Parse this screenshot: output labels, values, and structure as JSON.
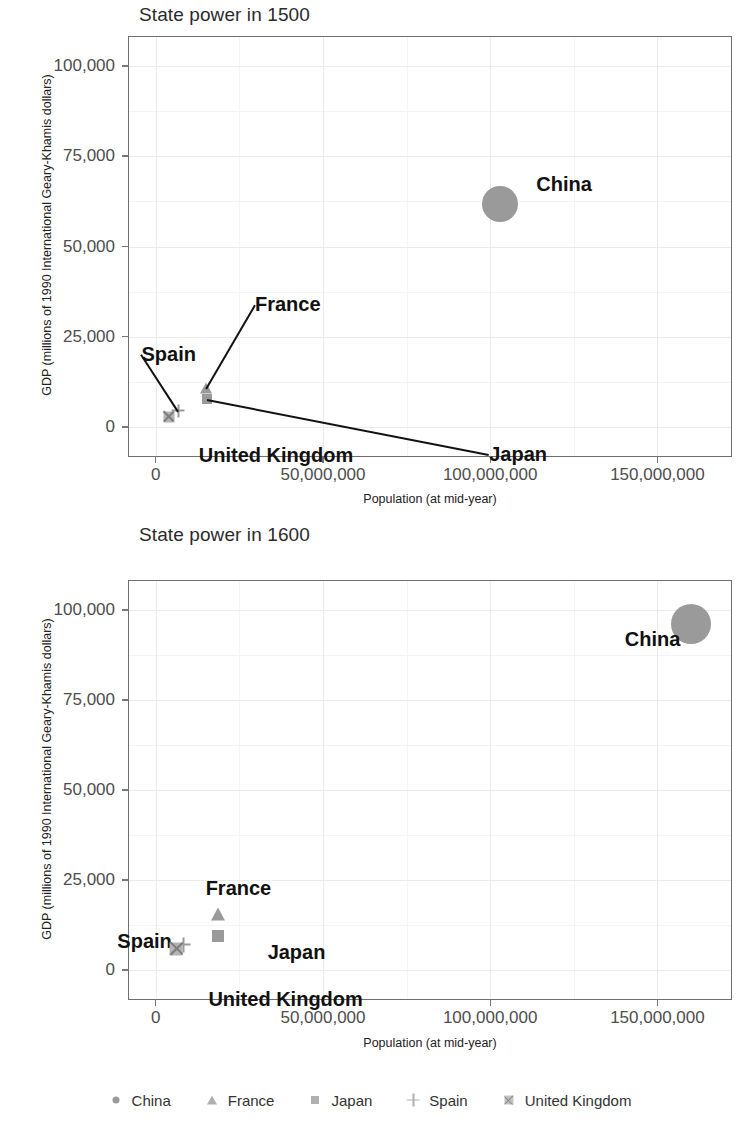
{
  "figure": {
    "legend": {
      "entries": [
        {
          "label": "China",
          "marker": "circle-icon"
        },
        {
          "label": "France",
          "marker": "triangle-icon"
        },
        {
          "label": "Japan",
          "marker": "square-icon"
        },
        {
          "label": "Spain",
          "marker": "plus-icon"
        },
        {
          "label": "United Kingdom",
          "marker": "crossed-square-icon"
        }
      ]
    },
    "marker_color": "#9a9a9a",
    "panel_border_color": "#6e6e6e",
    "grid_color": "#ebebeb"
  },
  "chart_data": [
    {
      "type": "scatter",
      "title": "State power in 1500",
      "xlabel": "Population (at mid-year)",
      "ylabel": "GDP (millions of 1990 International Geary-Khamis dollars)",
      "xlim": [
        -8000000,
        172000000
      ],
      "ylim": [
        -8000,
        108000
      ],
      "xticks": [
        0,
        50000000,
        100000000,
        150000000
      ],
      "xticklabels": [
        "0",
        "50,000,000",
        "100,000,000",
        "150,000,000"
      ],
      "yticks": [
        0,
        25000,
        50000,
        75000,
        100000
      ],
      "yticklabels": [
        "0",
        "25,000",
        "50,000",
        "75,000",
        "100,000"
      ],
      "grid": true,
      "legend_position": "bottom",
      "size_encodes": "GDP",
      "points": [
        {
          "name": "China",
          "marker": "circle",
          "x": 103000000,
          "y": 61800,
          "size": 36,
          "label": "China",
          "label_dx": 36,
          "label_dy": -30,
          "leader": false
        },
        {
          "name": "France",
          "marker": "triangle",
          "x": 15000000,
          "y": 10912,
          "size": 11,
          "label": "France",
          "label_dx": 49,
          "label_dy": -94,
          "leader": true
        },
        {
          "name": "Japan",
          "marker": "square",
          "x": 15400000,
          "y": 7700,
          "size": 10,
          "label": "Japan",
          "label_dx": 282,
          "label_dy": 45,
          "leader": true
        },
        {
          "name": "Spain",
          "marker": "plus",
          "x": 6800000,
          "y": 4495,
          "size": 10,
          "label": "Spain",
          "label_dx": -37,
          "label_dy": -67,
          "leader": true
        },
        {
          "name": "United Kingdom",
          "marker": "crossed-square",
          "x": 3900000,
          "y": 2815,
          "size": 11,
          "label": "United Kingdom",
          "label_dx": 30,
          "label_dy": 28,
          "leader": false
        }
      ]
    },
    {
      "type": "scatter",
      "title": "State power in 1600",
      "xlabel": "Population (at mid-year)",
      "ylabel": "GDP (millions of 1990 International Geary-Khamis dollars)",
      "xlim": [
        -8000000,
        172000000
      ],
      "ylim": [
        -8000,
        108000
      ],
      "xticks": [
        0,
        50000000,
        100000000,
        150000000
      ],
      "xticklabels": [
        "0",
        "50,000,000",
        "100,000,000",
        "150,000,000"
      ],
      "yticks": [
        0,
        25000,
        50000,
        75000,
        100000
      ],
      "yticklabels": [
        "0",
        "25,000",
        "50,000",
        "75,000",
        "100,000"
      ],
      "grid": true,
      "legend_position": "bottom",
      "size_encodes": "GDP",
      "points": [
        {
          "name": "China",
          "marker": "circle",
          "x": 160000000,
          "y": 96000,
          "size": 40,
          "label": "China",
          "label_dx": -66,
          "label_dy": 5,
          "leader": false
        },
        {
          "name": "France",
          "marker": "triangle",
          "x": 18500000,
          "y": 15559,
          "size": 13,
          "label": "France",
          "label_dx": -12,
          "label_dy": -36,
          "leader": false
        },
        {
          "name": "Japan",
          "marker": "square",
          "x": 18500000,
          "y": 9620,
          "size": 12,
          "label": "Japan",
          "label_dx": 50,
          "label_dy": 6,
          "leader": false
        },
        {
          "name": "Spain",
          "marker": "plus",
          "x": 8240000,
          "y": 7029,
          "size": 12,
          "label": "Spain",
          "label_dx": -66,
          "label_dy": -14,
          "leader": false
        },
        {
          "name": "United Kingdom",
          "marker": "crossed-square",
          "x": 6170000,
          "y": 6007,
          "size": 13,
          "label": "United Kingdom",
          "label_dx": 32,
          "label_dy": 40,
          "leader": false
        }
      ]
    }
  ]
}
